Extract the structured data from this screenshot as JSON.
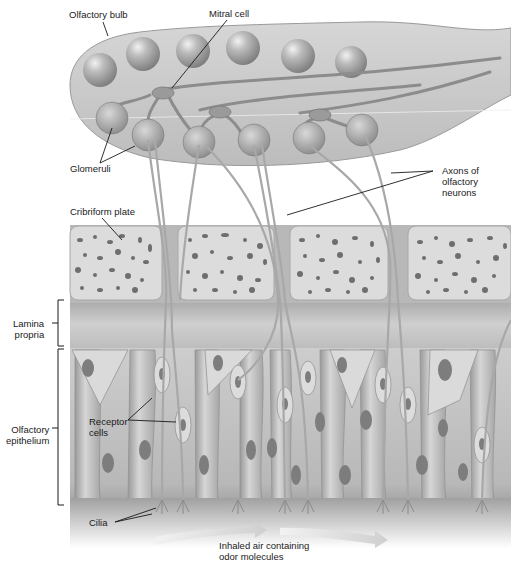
{
  "figure": {
    "type": "anatomical-diagram",
    "palette": {
      "bulb_fill": "#c9c9c9",
      "sphere_fill": "#b0b0b0",
      "bone_fill": "#dcdcdc",
      "bone_pore": "#6e6e6e",
      "lamina_fill": "#c4c4c4",
      "epithelium_fill": "#bdbdbd",
      "nucleus_fill": "#7d7d7d",
      "leader_line": "#1a1a1a",
      "airflow_arrow": "#d8d8d8"
    }
  },
  "labels": {
    "olfactory_bulb": "Olfactory bulb",
    "mitral_cell": "Mitral cell",
    "glomeruli": "Glomeruli",
    "axons_of_olfactory_neurons": "Axons of\nolfactory\nneurons",
    "cribriform_plate": "Cribriform plate",
    "lamina_propria": "Lamina\npropria",
    "olfactory_epithelium": "Olfactory\nepithelium",
    "receptor_cells": "Receptor\ncells",
    "cilia": "Cilia",
    "inhaled_air": "Inhaled air containing\nodor molecules"
  },
  "structure": {
    "upper_glomeruli_count": 6,
    "lower_glomeruli_count": 6,
    "cribriform_plate_segments": 4,
    "airflow_arrows": 2
  }
}
